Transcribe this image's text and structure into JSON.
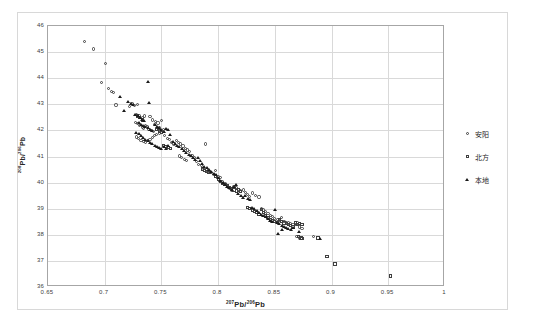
{
  "chart_data": {
    "type": "scatter",
    "title": "",
    "xlabel": "207Pb/206Pb",
    "ylabel": "208Pb/206Pb",
    "xlabel_parts": {
      "sup1": "207",
      "mid": "Pb/",
      "sup2": "206",
      "end": "Pb"
    },
    "ylabel_parts": {
      "sup1": "208",
      "mid": "Pb/",
      "sup2": "206",
      "end": "Pb"
    },
    "xlim": [
      0.65,
      1.0
    ],
    "ylim": [
      36,
      46
    ],
    "xticks": [
      "0.65",
      "0.7",
      "0.75",
      "0.8",
      "0.85",
      "0.9",
      "0.95",
      "1"
    ],
    "xtick_values": [
      0.65,
      0.7,
      0.75,
      0.8,
      0.85,
      0.9,
      0.95,
      1.0
    ],
    "yticks": [
      "36",
      "37",
      "38",
      "39",
      "40",
      "41",
      "42",
      "43",
      "44",
      "45",
      "46"
    ],
    "ytick_values": [
      36,
      37,
      38,
      39,
      40,
      41,
      42,
      43,
      44,
      45,
      46
    ],
    "grid": true,
    "legend_position": "right",
    "legend": [
      {
        "label": "安阳",
        "marker": "circle"
      },
      {
        "label": "北方",
        "marker": "square"
      },
      {
        "label": "本地",
        "marker": "triangle"
      }
    ],
    "series": [
      {
        "name": "安阳",
        "marker": "circle",
        "points": [
          [
            0.682,
            45.4
          ],
          [
            0.69,
            45.12
          ],
          [
            0.701,
            44.57
          ],
          [
            0.697,
            43.85
          ],
          [
            0.703,
            43.6
          ],
          [
            0.708,
            43.44
          ],
          [
            0.706,
            43.48
          ],
          [
            0.71,
            42.97
          ],
          [
            0.722,
            42.93
          ],
          [
            0.724,
            43.02
          ],
          [
            0.726,
            42.95
          ],
          [
            0.729,
            43.0
          ],
          [
            0.728,
            42.62
          ],
          [
            0.731,
            42.55
          ],
          [
            0.733,
            42.5
          ],
          [
            0.735,
            42.55
          ],
          [
            0.74,
            42.52
          ],
          [
            0.742,
            42.4
          ],
          [
            0.727,
            42.3
          ],
          [
            0.729,
            42.25
          ],
          [
            0.731,
            42.18
          ],
          [
            0.733,
            42.12
          ],
          [
            0.734,
            42.08
          ],
          [
            0.736,
            42.2
          ],
          [
            0.738,
            42.15
          ],
          [
            0.739,
            42.05
          ],
          [
            0.741,
            42.0
          ],
          [
            0.743,
            41.95
          ],
          [
            0.745,
            42.35
          ],
          [
            0.747,
            42.28
          ],
          [
            0.744,
            42.22
          ],
          [
            0.748,
            42.1
          ],
          [
            0.75,
            42.38
          ],
          [
            0.752,
            42.05
          ],
          [
            0.748,
            41.9
          ],
          [
            0.746,
            41.85
          ],
          [
            0.744,
            41.8
          ],
          [
            0.742,
            41.72
          ],
          [
            0.74,
            41.65
          ],
          [
            0.738,
            41.6
          ],
          [
            0.736,
            41.55
          ],
          [
            0.734,
            41.58
          ],
          [
            0.732,
            41.62
          ],
          [
            0.73,
            41.68
          ],
          [
            0.728,
            41.75
          ],
          [
            0.753,
            41.82
          ],
          [
            0.755,
            41.7
          ],
          [
            0.757,
            41.65
          ],
          [
            0.759,
            41.55
          ],
          [
            0.761,
            41.48
          ],
          [
            0.763,
            41.6
          ],
          [
            0.765,
            41.55
          ],
          [
            0.767,
            41.48
          ],
          [
            0.769,
            41.4
          ],
          [
            0.771,
            41.3
          ],
          [
            0.773,
            41.25
          ],
          [
            0.775,
            41.18
          ],
          [
            0.777,
            41.05
          ],
          [
            0.779,
            40.95
          ],
          [
            0.766,
            41.02
          ],
          [
            0.768,
            40.96
          ],
          [
            0.77,
            40.9
          ],
          [
            0.772,
            40.85
          ],
          [
            0.789,
            41.48
          ],
          [
            0.781,
            40.8
          ],
          [
            0.783,
            40.7
          ],
          [
            0.785,
            40.65
          ],
          [
            0.787,
            40.55
          ],
          [
            0.79,
            40.48
          ],
          [
            0.792,
            40.42
          ],
          [
            0.794,
            40.38
          ],
          [
            0.796,
            40.32
          ],
          [
            0.798,
            40.45
          ],
          [
            0.8,
            40.22
          ],
          [
            0.802,
            40.18
          ],
          [
            0.804,
            40.05
          ],
          [
            0.806,
            39.95
          ],
          [
            0.808,
            39.85
          ],
          [
            0.81,
            39.78
          ],
          [
            0.812,
            39.72
          ],
          [
            0.814,
            39.85
          ],
          [
            0.816,
            39.8
          ],
          [
            0.818,
            39.75
          ],
          [
            0.82,
            39.68
          ],
          [
            0.822,
            39.72
          ],
          [
            0.824,
            39.62
          ],
          [
            0.826,
            39.55
          ],
          [
            0.828,
            39.48
          ],
          [
            0.83,
            39.6
          ],
          [
            0.833,
            39.52
          ],
          [
            0.836,
            39.45
          ],
          [
            0.838,
            39.02
          ],
          [
            0.84,
            38.95
          ],
          [
            0.842,
            38.88
          ],
          [
            0.844,
            38.82
          ],
          [
            0.846,
            38.75
          ],
          [
            0.848,
            38.7
          ],
          [
            0.85,
            38.62
          ],
          [
            0.852,
            38.58
          ],
          [
            0.854,
            38.55
          ],
          [
            0.856,
            38.65
          ],
          [
            0.858,
            38.52
          ],
          [
            0.86,
            38.48
          ],
          [
            0.862,
            38.45
          ],
          [
            0.864,
            38.42
          ],
          [
            0.866,
            38.4
          ],
          [
            0.868,
            38.38
          ],
          [
            0.87,
            38.45
          ],
          [
            0.872,
            38.3
          ],
          [
            0.874,
            38.25
          ],
          [
            0.869,
            37.92
          ],
          [
            0.872,
            37.88
          ],
          [
            0.884,
            37.92
          ]
        ]
      },
      {
        "name": "北方",
        "marker": "square",
        "points": [
          [
            0.729,
            42.55
          ],
          [
            0.731,
            42.48
          ],
          [
            0.733,
            42.4
          ],
          [
            0.746,
            42.02
          ],
          [
            0.748,
            41.98
          ],
          [
            0.75,
            41.92
          ],
          [
            0.752,
            41.42
          ],
          [
            0.754,
            41.38
          ],
          [
            0.756,
            41.35
          ],
          [
            0.758,
            41.3
          ],
          [
            0.786,
            40.52
          ],
          [
            0.788,
            40.46
          ],
          [
            0.79,
            40.42
          ],
          [
            0.792,
            40.38
          ],
          [
            0.798,
            40.25
          ],
          [
            0.8,
            40.12
          ],
          [
            0.802,
            40.05
          ],
          [
            0.804,
            39.98
          ],
          [
            0.806,
            39.92
          ],
          [
            0.808,
            39.88
          ],
          [
            0.81,
            39.82
          ],
          [
            0.812,
            39.78
          ],
          [
            0.814,
            39.72
          ],
          [
            0.816,
            39.68
          ],
          [
            0.818,
            39.72
          ],
          [
            0.82,
            39.65
          ],
          [
            0.826,
            39.05
          ],
          [
            0.828,
            39.0
          ],
          [
            0.83,
            38.95
          ],
          [
            0.832,
            38.9
          ],
          [
            0.834,
            38.85
          ],
          [
            0.836,
            38.78
          ],
          [
            0.838,
            38.98
          ],
          [
            0.84,
            38.85
          ],
          [
            0.842,
            38.72
          ],
          [
            0.844,
            38.65
          ],
          [
            0.846,
            38.6
          ],
          [
            0.848,
            38.55
          ],
          [
            0.85,
            38.52
          ],
          [
            0.852,
            38.48
          ],
          [
            0.854,
            38.58
          ],
          [
            0.856,
            38.52
          ],
          [
            0.858,
            38.45
          ],
          [
            0.86,
            38.42
          ],
          [
            0.862,
            38.38
          ],
          [
            0.864,
            38.35
          ],
          [
            0.866,
            38.3
          ],
          [
            0.868,
            38.45
          ],
          [
            0.87,
            38.4
          ],
          [
            0.872,
            38.42
          ],
          [
            0.874,
            38.38
          ],
          [
            0.871,
            37.92
          ],
          [
            0.873,
            37.88
          ],
          [
            0.874,
            37.85
          ],
          [
            0.888,
            37.88
          ],
          [
            0.896,
            37.18
          ],
          [
            0.903,
            36.88
          ],
          [
            0.952,
            36.42
          ]
        ]
      },
      {
        "name": "本地",
        "marker": "triangle",
        "points": [
          [
            0.714,
            43.3
          ],
          [
            0.717,
            42.75
          ],
          [
            0.721,
            43.08
          ],
          [
            0.723,
            43.02
          ],
          [
            0.725,
            42.98
          ],
          [
            0.738,
            43.84
          ],
          [
            0.739,
            43.05
          ],
          [
            0.727,
            42.6
          ],
          [
            0.729,
            42.55
          ],
          [
            0.731,
            42.48
          ],
          [
            0.733,
            42.42
          ],
          [
            0.735,
            42.35
          ],
          [
            0.73,
            42.3
          ],
          [
            0.732,
            42.22
          ],
          [
            0.734,
            42.18
          ],
          [
            0.736,
            42.12
          ],
          [
            0.738,
            42.08
          ],
          [
            0.74,
            42.02
          ],
          [
            0.742,
            41.98
          ],
          [
            0.744,
            42.2
          ],
          [
            0.746,
            42.15
          ],
          [
            0.748,
            42.08
          ],
          [
            0.75,
            42.02
          ],
          [
            0.752,
            41.95
          ],
          [
            0.754,
            42.05
          ],
          [
            0.756,
            42.02
          ],
          [
            0.728,
            41.9
          ],
          [
            0.73,
            41.85
          ],
          [
            0.732,
            41.8
          ],
          [
            0.734,
            41.72
          ],
          [
            0.736,
            41.65
          ],
          [
            0.738,
            41.58
          ],
          [
            0.74,
            41.52
          ],
          [
            0.742,
            41.48
          ],
          [
            0.744,
            41.42
          ],
          [
            0.746,
            41.38
          ],
          [
            0.748,
            41.32
          ],
          [
            0.75,
            41.28
          ],
          [
            0.752,
            41.35
          ],
          [
            0.754,
            41.3
          ],
          [
            0.756,
            41.42
          ],
          [
            0.758,
            41.82
          ],
          [
            0.76,
            41.55
          ],
          [
            0.762,
            41.48
          ],
          [
            0.764,
            41.42
          ],
          [
            0.766,
            41.35
          ],
          [
            0.768,
            41.28
          ],
          [
            0.77,
            41.22
          ],
          [
            0.772,
            41.15
          ],
          [
            0.774,
            41.08
          ],
          [
            0.776,
            41.02
          ],
          [
            0.778,
            40.95
          ],
          [
            0.78,
            40.88
          ],
          [
            0.782,
            40.95
          ],
          [
            0.784,
            40.82
          ],
          [
            0.786,
            40.72
          ],
          [
            0.788,
            40.62
          ],
          [
            0.79,
            40.55
          ],
          [
            0.792,
            40.48
          ],
          [
            0.794,
            40.42
          ],
          [
            0.796,
            40.35
          ],
          [
            0.798,
            40.28
          ],
          [
            0.8,
            40.18
          ],
          [
            0.802,
            40.08
          ],
          [
            0.804,
            39.98
          ],
          [
            0.806,
            39.92
          ],
          [
            0.808,
            39.85
          ],
          [
            0.81,
            39.78
          ],
          [
            0.812,
            39.72
          ],
          [
            0.814,
            39.82
          ],
          [
            0.816,
            39.9
          ],
          [
            0.818,
            39.55
          ],
          [
            0.82,
            39.48
          ],
          [
            0.822,
            39.42
          ],
          [
            0.824,
            39.48
          ],
          [
            0.826,
            39.38
          ],
          [
            0.828,
            39.32
          ],
          [
            0.83,
            39.05
          ],
          [
            0.832,
            38.98
          ],
          [
            0.834,
            38.92
          ],
          [
            0.836,
            38.85
          ],
          [
            0.838,
            38.78
          ],
          [
            0.84,
            38.72
          ],
          [
            0.842,
            38.68
          ],
          [
            0.844,
            38.62
          ],
          [
            0.846,
            38.55
          ],
          [
            0.848,
            38.5
          ],
          [
            0.85,
            38.95
          ],
          [
            0.852,
            38.45
          ],
          [
            0.854,
            38.4
          ],
          [
            0.856,
            38.35
          ],
          [
            0.858,
            38.3
          ],
          [
            0.86,
            38.25
          ],
          [
            0.853,
            38.02
          ],
          [
            0.856,
            38.18
          ],
          [
            0.862,
            38.22
          ],
          [
            0.864,
            38.18
          ],
          [
            0.866,
            38.28
          ],
          [
            0.871,
            38.12
          ],
          [
            0.89,
            37.85
          ]
        ]
      }
    ]
  }
}
